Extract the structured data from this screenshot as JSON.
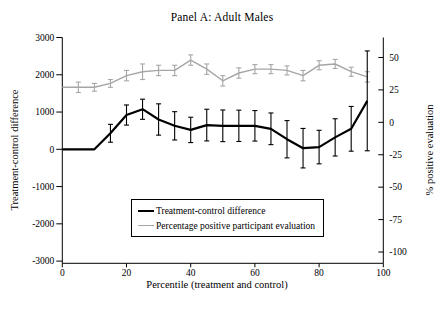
{
  "title": "Panel A: Adult Males",
  "chart_data": {
    "type": "line",
    "title": "Panel A: Adult Males",
    "x_label": "Percentile (treatment and control)",
    "x_ticks": [
      0,
      20,
      40,
      60,
      80,
      100
    ],
    "x_range": [
      0,
      100
    ],
    "grid": false,
    "background": "#ffffff",
    "legend_position": "inside-bottom-center",
    "left_axis": {
      "label": "Treatment-control difference",
      "ticks": [
        3000,
        2000,
        1000,
        0,
        -1000,
        -2000,
        -3000
      ],
      "range": [
        -3059,
        3000
      ]
    },
    "right_axis": {
      "label": "% positive evaluation",
      "ticks": [
        50,
        25,
        0,
        -25,
        -50,
        -75,
        -100
      ],
      "range": [
        -108.7,
        65.4
      ]
    },
    "x": [
      0,
      5,
      10,
      15,
      20,
      25,
      30,
      35,
      40,
      45,
      50,
      55,
      60,
      65,
      70,
      75,
      80,
      85,
      90,
      95
    ],
    "series": [
      {
        "name": "Treatment-control difference",
        "axis": "left",
        "color": "#000000",
        "line_width": 2.2,
        "error_bar_width": 1.1,
        "values": [
          0,
          0,
          0,
          430,
          920,
          1075,
          800,
          630,
          520,
          650,
          630,
          630,
          630,
          550,
          270,
          30,
          60,
          320,
          550,
          1300
        ],
        "errors": [
          0,
          0,
          0,
          240,
          270,
          270,
          420,
          380,
          340,
          425,
          425,
          420,
          410,
          425,
          500,
          530,
          450,
          500,
          600,
          1340
        ]
      },
      {
        "name": "Percentage positive participant evaluation",
        "axis": "right",
        "color": "#a6a6a6",
        "line_width": 1.4,
        "error_bar_width": 1.1,
        "values": [
          27,
          27,
          27,
          30,
          36,
          39,
          40,
          40,
          48,
          41,
          32,
          38,
          41,
          41,
          40,
          36,
          44,
          45,
          39,
          35
        ],
        "errors": [
          0,
          4,
          3,
          3,
          4,
          6,
          4,
          4,
          4,
          4,
          4,
          4,
          3.5,
          3.5,
          3.5,
          4,
          3.5,
          3.5,
          3.5,
          4
        ]
      }
    ]
  },
  "legend": {
    "items": [
      {
        "label": "Treatment-control difference"
      },
      {
        "label": "Percentage positive participant evaluation"
      }
    ]
  }
}
